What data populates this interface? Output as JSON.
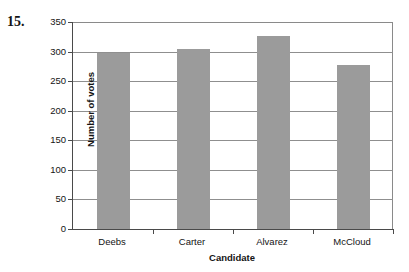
{
  "problem": {
    "number": "15."
  },
  "chart_data": {
    "type": "bar",
    "title": "",
    "xlabel": "Candidate",
    "ylabel": "Number of votes",
    "categories": [
      "Deebs",
      "Carter",
      "Alvarez",
      "McCloud"
    ],
    "values": [
      297,
      304,
      326,
      278
    ],
    "ylim": [
      0,
      350
    ],
    "ytick_labels": [
      "0",
      "50",
      "100",
      "150",
      "200",
      "250",
      "300",
      "350"
    ],
    "ytick_values": [
      0,
      50,
      100,
      150,
      200,
      250,
      300,
      350
    ],
    "grid": "horizontal",
    "legend": "none",
    "bar_color": "#9b9b9b",
    "axis_color": "#4a4a4a",
    "gridline_color": "#8f8f8f",
    "background": "#ffffff"
  }
}
